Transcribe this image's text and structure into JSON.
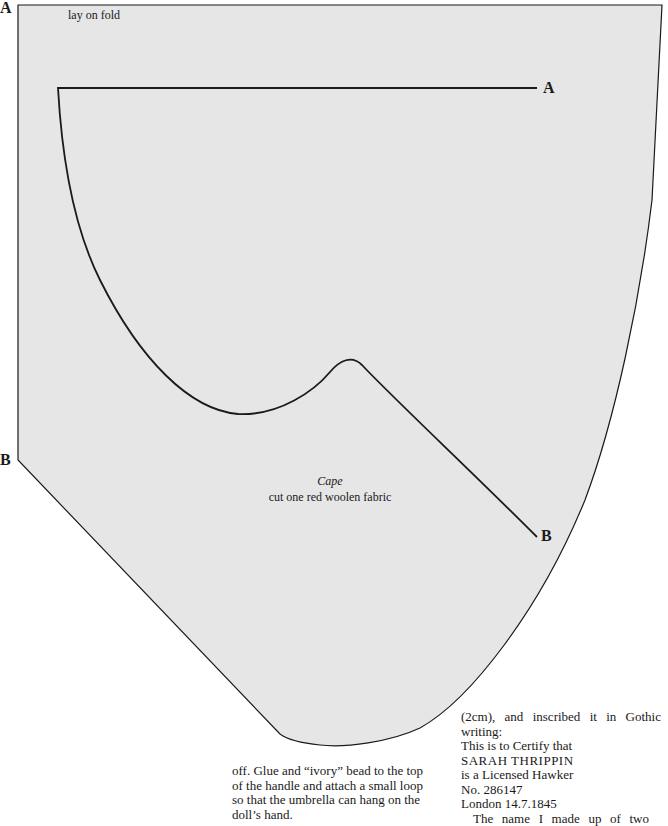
{
  "pattern": {
    "title": "Cape",
    "instruction": "cut one red woolen fabric",
    "fold_note": "lay on fold",
    "markers": {
      "top_left": "A",
      "top_right": "A",
      "left_b": "B",
      "right_b": "B"
    },
    "colors": {
      "fill": "#e6e6e6",
      "line": "#1a1a1a",
      "page": "#ffffff"
    }
  },
  "text_columns": {
    "left": {
      "lines": [
        "off. Glue and “ivory” bead to the top",
        "of the handle and attach a small loop",
        "so that the umbrella can hang on the",
        "doll’s hand."
      ]
    },
    "right": {
      "lines": [
        "(2cm), and inscribed it in Gothic",
        "writing:",
        "This is to Certify that",
        "SARAH THRIPPIN",
        "is a Licensed Hawker",
        "No. 286147",
        "London 14.7.1845",
        "The name I made up of two"
      ]
    }
  }
}
